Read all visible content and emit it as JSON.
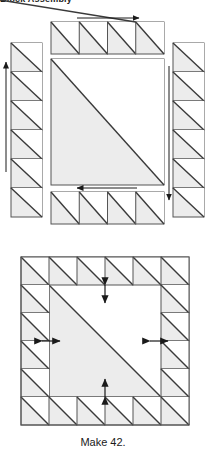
{
  "heading": {
    "text": "Block Assembly"
  },
  "caption": {
    "text": "Make 42."
  },
  "colors": {
    "shaded_fill": "#ececec",
    "plain_fill": "#ffffff",
    "outline": "#555555",
    "diagonal": "#3a3a3a",
    "arrow": "#1a1a1a",
    "background": "#ffffff"
  },
  "diagram": {
    "type": "quilt-block-assembly",
    "exploded_view": {
      "name": "exploded-block-layout",
      "center_unit": {
        "name": "center-half-square-triangle",
        "shaded_corner": "lower-left",
        "plain_corner": "upper-right",
        "diagonal_direction": "top-left-to-bottom-right",
        "x": 51,
        "y": 59,
        "width": 113,
        "height": 126
      },
      "strips": [
        {
          "name": "top-strip",
          "position": "top",
          "unit_count": 4,
          "orientation": "horizontal",
          "unit_diagonal": "top-left-to-bottom-right",
          "x": 51,
          "y": 22,
          "width": 113,
          "height": 32,
          "arrow": {
            "name": "top-strip-direction-arrow",
            "direction": "right",
            "x1": 77,
            "y1": 18,
            "x2": 139,
            "y2": 18
          }
        },
        {
          "name": "left-strip",
          "position": "left",
          "unit_count": 6,
          "orientation": "vertical",
          "unit_diagonal": "top-left-to-bottom-right",
          "x": 11,
          "y": 43,
          "width": 31,
          "height": 174,
          "arrow": {
            "name": "left-strip-direction-arrow",
            "direction": "up",
            "x1": 6,
            "y1": 172,
            "x2": 6,
            "y2": 62
          }
        },
        {
          "name": "right-strip",
          "position": "right",
          "unit_count": 6,
          "orientation": "vertical",
          "unit_diagonal": "top-left-to-bottom-right",
          "x": 173,
          "y": 43,
          "width": 31,
          "height": 174,
          "arrow": {
            "name": "right-strip-direction-arrow",
            "direction": "down",
            "x1": 169,
            "y1": 66,
            "x2": 169,
            "y2": 200
          }
        },
        {
          "name": "bottom-strip",
          "position": "bottom",
          "unit_count": 4,
          "orientation": "horizontal",
          "unit_diagonal": "top-left-to-bottom-right",
          "x": 51,
          "y": 192,
          "width": 113,
          "height": 32,
          "arrow": {
            "name": "bottom-strip-direction-arrow",
            "direction": "left",
            "x1": 137,
            "y1": 188,
            "x2": 77,
            "y2": 188
          }
        }
      ]
    },
    "assembled_view": {
      "name": "assembled-block",
      "grid_columns": 6,
      "grid_rows": 6,
      "x": 21,
      "y": 257,
      "width": 168,
      "height": 168,
      "center_unit": {
        "name": "assembled-center-triangle",
        "shaded_corner": "lower-left",
        "plain_corner": "upper-right",
        "span_columns": 4,
        "span_rows": 4
      },
      "border_units": {
        "name": "border-half-square-triangles",
        "count": 20,
        "unit_diagonal": "top-left-to-bottom-right"
      },
      "pressing_arrows": [
        {
          "name": "pressing-arrow-top",
          "orientation": "vertical",
          "cx": 105,
          "cy": 294,
          "length": 18
        },
        {
          "name": "pressing-arrow-left",
          "orientation": "horizontal",
          "cx": 51,
          "cy": 341,
          "length": 18
        },
        {
          "name": "pressing-arrow-right",
          "orientation": "horizontal",
          "cx": 159,
          "cy": 341,
          "length": 18
        },
        {
          "name": "pressing-arrow-bottom",
          "orientation": "vertical",
          "cx": 105,
          "cy": 388,
          "length": 18
        }
      ]
    }
  }
}
